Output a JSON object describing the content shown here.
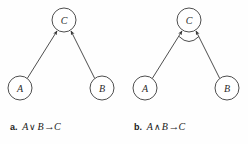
{
  "figure": {
    "background_color": "#fefefe",
    "stroke_color": "#3a3a3a",
    "node_fill": "#ffffff",
    "text_color": "#1a1a1a"
  },
  "panels": [
    {
      "id": "panel-a",
      "tag": "a.",
      "formula": {
        "left_operand": "A",
        "operator": "∨",
        "right_operand": "B",
        "arrow": "→",
        "result": "C"
      },
      "connective": "or",
      "arc_marker": false,
      "nodes": [
        {
          "label": "C",
          "cx": 64,
          "cy": 20,
          "r": 12
        },
        {
          "label": "A",
          "cx": 20,
          "cy": 88,
          "r": 12
        },
        {
          "label": "B",
          "cx": 102,
          "cy": 88,
          "r": 12
        }
      ],
      "edges": [
        {
          "from": "A",
          "to": "C",
          "arrowhead": true
        },
        {
          "from": "B",
          "to": "C",
          "arrowhead": true
        }
      ]
    },
    {
      "id": "panel-b",
      "tag": "b.",
      "formula": {
        "left_operand": "A",
        "operator": "∧",
        "right_operand": "B",
        "arrow": "→",
        "result": "C"
      },
      "connective": "and",
      "arc_marker": true,
      "nodes": [
        {
          "label": "C",
          "cx": 189,
          "cy": 20,
          "r": 12
        },
        {
          "label": "A",
          "cx": 145,
          "cy": 88,
          "r": 12
        },
        {
          "label": "B",
          "cx": 227,
          "cy": 88,
          "r": 12
        }
      ],
      "edges": [
        {
          "from": "A",
          "to": "C",
          "arrowhead": true
        },
        {
          "from": "B",
          "to": "C",
          "arrowhead": true
        }
      ]
    }
  ],
  "labels": {
    "node_a_left": "A",
    "node_b_left": "B",
    "node_c_left": "C",
    "node_a_right": "A",
    "node_b_right": "B",
    "node_c_right": "C"
  }
}
